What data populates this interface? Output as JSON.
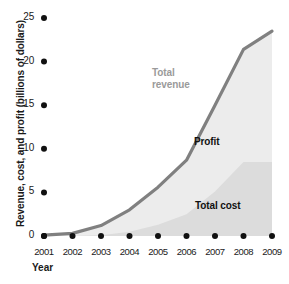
{
  "chart_data": {
    "type": "area",
    "title": "",
    "xlabel": "Year",
    "ylabel": "Revenue, cost, and profit (billions of dollars)",
    "categories": [
      "2001",
      "2002",
      "2003",
      "2004",
      "2005",
      "2006",
      "2007",
      "2008",
      "2009"
    ],
    "x": [
      2001,
      2002,
      2003,
      2004,
      2005,
      2006,
      2007,
      2008,
      2009
    ],
    "xlim": [
      2001,
      2009
    ],
    "ylim": [
      0,
      25
    ],
    "yticks": [
      0,
      5,
      10,
      15,
      20,
      25
    ],
    "grid": false,
    "legend_position": "inline-annotations",
    "series": [
      {
        "name": "Total revenue",
        "style": "line",
        "color": "#808080",
        "values": [
          0.1,
          0.3,
          1.2,
          3.0,
          5.6,
          8.7,
          15.0,
          21.4,
          23.5
        ]
      },
      {
        "name": "Profit",
        "style": "band",
        "color": "#ececec",
        "values": [
          0.1,
          0.3,
          1.1,
          2.5,
          4.3,
          6.2,
          9.9,
          12.9,
          15.0
        ]
      },
      {
        "name": "Total cost",
        "style": "band",
        "color": "#dcdcdc",
        "values": [
          0.0,
          0.0,
          0.1,
          0.5,
          1.3,
          2.5,
          5.1,
          8.5,
          8.5
        ]
      }
    ],
    "annotations": [
      {
        "text": "Total revenue",
        "series": "Total revenue",
        "color": "#9a9a9a"
      },
      {
        "text": "Profit",
        "series": "Profit",
        "color": "#111111"
      },
      {
        "text": "Total cost",
        "series": "Total cost",
        "color": "#111111"
      }
    ]
  },
  "axes": {
    "y_title": "Revenue, cost, and profit (billions of dollars)",
    "x_title": "Year",
    "y_tick_labels": [
      "25",
      "20",
      "15",
      "10",
      "5",
      "0"
    ],
    "x_tick_labels": [
      "2001",
      "2002",
      "2003",
      "2004",
      "2005",
      "2006",
      "2007",
      "2008",
      "2009"
    ]
  },
  "labels": {
    "revenue_line1": "Total",
    "revenue_line2": "revenue",
    "profit": "Profit",
    "total_cost": "Total cost"
  },
  "colors": {
    "revenue_line": "#808080",
    "profit_fill": "#ececec",
    "cost_fill": "#dcdcdc",
    "revenue_label": "#9a9a9a",
    "text": "#1a1a1a"
  }
}
